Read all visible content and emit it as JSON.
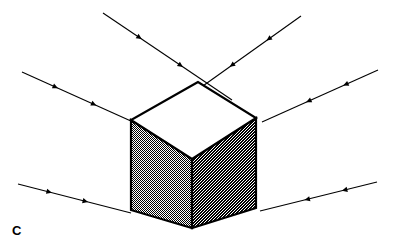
{
  "figure": {
    "panel_label": "C",
    "caption_visible_text": "C",
    "background_color": "#ffffff",
    "stroke_color": "#000000",
    "width": 394,
    "height": 251
  },
  "cube": {
    "name": "isometric-cube",
    "top_face": {
      "label": "top-face",
      "fill": "#ffffff",
      "shading": "none",
      "points": "198,82 131,120 192,159 256,118"
    },
    "left_face": {
      "label": "left-face",
      "fill": "#b4b4b4",
      "shading": "light-dither",
      "points": "131,120 131,210 192,228 192,159"
    },
    "right_face": {
      "label": "right-face",
      "fill": "#5e5e5e",
      "shading": "dark-dither",
      "points": "192,159 192,228 256,208 256,118"
    },
    "outline_width": 2.2,
    "vertices": {
      "top": [
        198,
        82
      ],
      "left_upper": [
        131,
        120
      ],
      "center_front_upper": [
        192,
        159
      ],
      "right_upper": [
        256,
        118
      ],
      "left_lower": [
        131,
        210
      ],
      "bottom": [
        192,
        228
      ],
      "right_lower": [
        256,
        208
      ]
    }
  },
  "rays": {
    "count": 6,
    "description": "directional light rays converging toward the cube",
    "stroke_width": 1.1,
    "arrowhead_count_per_ray": 2,
    "items": [
      {
        "name": "ray-top-left",
        "x1": 103,
        "y1": 13,
        "x2": 232,
        "y2": 100,
        "direction": "down-right",
        "arrow_positions": [
          0.3,
          0.62
        ]
      },
      {
        "name": "ray-top-right",
        "x1": 301,
        "y1": 16,
        "x2": 186,
        "y2": 98,
        "direction": "down-left",
        "arrow_positions": [
          0.3,
          0.62
        ]
      },
      {
        "name": "ray-middle-left",
        "x1": 22,
        "y1": 72,
        "x2": 142,
        "y2": 126,
        "direction": "down-right",
        "arrow_positions": [
          0.3,
          0.62
        ]
      },
      {
        "name": "ray-middle-right",
        "x1": 378,
        "y1": 70,
        "x2": 262,
        "y2": 122,
        "direction": "down-left",
        "arrow_positions": [
          0.3,
          0.62
        ]
      },
      {
        "name": "ray-bottom-left",
        "x1": 18,
        "y1": 184,
        "x2": 131,
        "y2": 213,
        "direction": "down-right",
        "arrow_positions": [
          0.3,
          0.62
        ]
      },
      {
        "name": "ray-bottom-right",
        "x1": 377,
        "y1": 182,
        "x2": 260,
        "y2": 211,
        "direction": "down-left",
        "arrow_positions": [
          0.3,
          0.62
        ]
      }
    ]
  }
}
